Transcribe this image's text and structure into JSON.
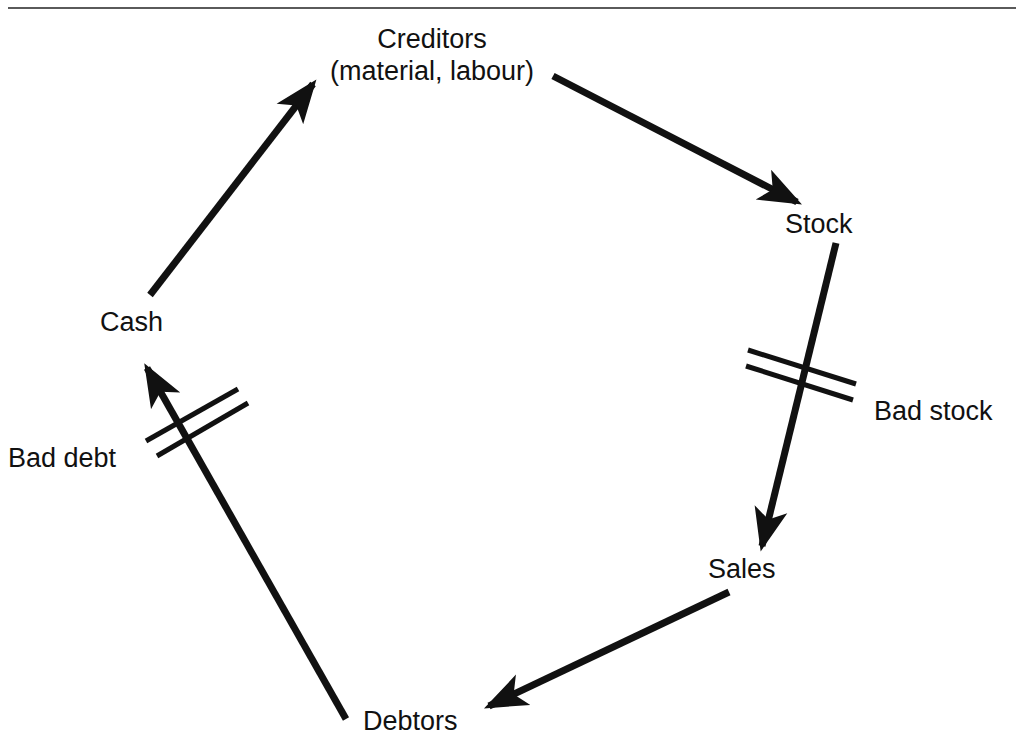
{
  "figure": {
    "type": "cycle-diagram",
    "has_top_rule": true,
    "background_color": "#ffffff",
    "stroke_color": "#111111"
  },
  "nodes": [
    {
      "id": "cash",
      "label": "Cash",
      "x": 136,
      "y": 322
    },
    {
      "id": "creditors",
      "label": "Creditors",
      "x": 432,
      "y": 38
    },
    {
      "id": "creditors_sub",
      "label": "(material, labour)",
      "x": 432,
      "y": 70
    },
    {
      "id": "stock",
      "label": "Stock",
      "x": 828,
      "y": 224
    },
    {
      "id": "sales",
      "label": "Sales",
      "x": 744,
      "y": 569
    },
    {
      "id": "debtors",
      "label": "Debtors",
      "x": 417,
      "y": 721
    }
  ],
  "arrows": [
    {
      "id": "cash-to-creditors",
      "from": "Cash",
      "to": "Creditors",
      "x1": 150,
      "y1": 295,
      "x2": 313,
      "y2": 84
    },
    {
      "id": "creditors-to-stock",
      "from": "Creditors",
      "to": "Stock",
      "x1": 553,
      "y1": 76,
      "x2": 797,
      "y2": 202
    },
    {
      "id": "stock-to-sales",
      "from": "Stock",
      "to": "Sales",
      "x1": 836,
      "y1": 243,
      "x2": 762,
      "y2": 546
    },
    {
      "id": "sales-to-debtors",
      "from": "Sales",
      "to": "Debtors",
      "x1": 729,
      "y1": 592,
      "x2": 489,
      "y2": 706
    },
    {
      "id": "debtors-to-cash",
      "from": "Debtors",
      "to": "Cash",
      "x1": 346,
      "y1": 719,
      "x2": 147,
      "y2": 368
    }
  ],
  "leakages": [
    {
      "id": "bad-debt",
      "label": "Bad debt",
      "on_arrow": "debtors-to-cash",
      "label_x": 8,
      "label_y": 443,
      "marks": [
        {
          "x1": 146,
          "y1": 441,
          "x2": 238,
          "y2": 389
        },
        {
          "x1": 157,
          "y1": 456,
          "x2": 248,
          "y2": 403
        }
      ]
    },
    {
      "id": "bad-stock",
      "label": "Bad stock",
      "on_arrow": "stock-to-sales",
      "label_x": 874,
      "label_y": 396,
      "marks": [
        {
          "x1": 748,
          "y1": 350,
          "x2": 856,
          "y2": 384
        },
        {
          "x1": 746,
          "y1": 366,
          "x2": 853,
          "y2": 400
        }
      ]
    }
  ],
  "icons": {
    "arrowhead": "arrowhead-icon",
    "slash_mark": "double-slash-break-icon"
  }
}
